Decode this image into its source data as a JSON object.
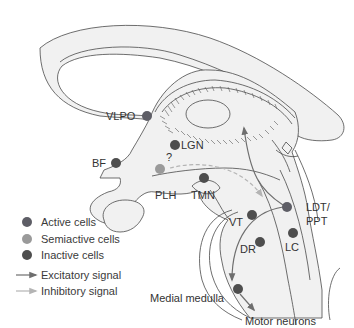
{
  "colors": {
    "active": "#5e5e66",
    "semiactive": "#9a9a9a",
    "inactive": "#4e4e4e",
    "excitatory": "#6e6e6e",
    "inhibitory": "#b4b4b4",
    "tissue": "#f1f1f1",
    "outline": "#4a4a4a"
  },
  "regions": {
    "vlpo": "VLPO",
    "lgn": "LGN",
    "bf": "BF",
    "question": "?",
    "plh": "PLH",
    "tmn": "TMN",
    "vt": "VT",
    "ldt_ppt_line1": "LDT/",
    "ldt_ppt_line2": "PPT",
    "dr": "DR",
    "lc": "LC",
    "medial_medulla": "Medial medulla",
    "motor_neurons": "Motor neurons"
  },
  "legend": {
    "items": [
      {
        "symbol": "dot",
        "state": "active",
        "label": "Active cells"
      },
      {
        "symbol": "dot",
        "state": "semiactive",
        "label": "Semiactive cells"
      },
      {
        "symbol": "dot",
        "state": "inactive",
        "label": "Inactive cells"
      },
      {
        "symbol": "arrow",
        "state": "excitatory",
        "label": "Excitatory signal"
      },
      {
        "symbol": "arrow",
        "state": "inhibitory",
        "label": "Inhibitory signal"
      }
    ]
  }
}
